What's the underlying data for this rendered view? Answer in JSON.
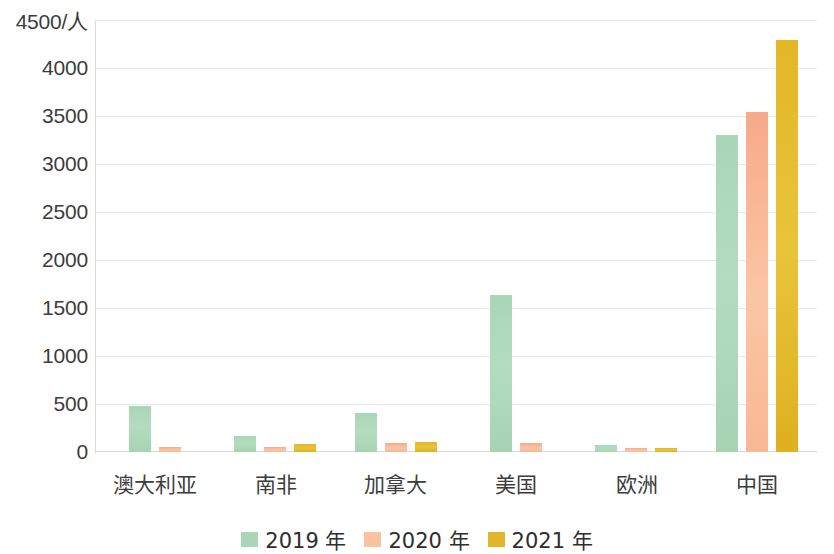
{
  "chart_data": {
    "type": "bar",
    "title": "",
    "xlabel": "",
    "ylabel": "4500/人",
    "unit_label": "/人",
    "ylim": [
      0,
      4500
    ],
    "ytick_step": 500,
    "yticks": [
      "4500/人",
      "4000",
      "3500",
      "3000",
      "2500",
      "2000",
      "1500",
      "1000",
      "500",
      "0"
    ],
    "ytick_values": [
      4500,
      4000,
      3500,
      3000,
      2500,
      2000,
      1500,
      1000,
      500,
      0
    ],
    "grid": true,
    "legend_position": "bottom-center",
    "categories": [
      "澳大利亚",
      "南非",
      "加拿大",
      "美国",
      "欧洲",
      "中国"
    ],
    "series": [
      {
        "name": "2019 年",
        "color": "#a9d6b6",
        "values": [
          480,
          165,
          405,
          1640,
          70,
          3300
        ]
      },
      {
        "name": "2020 年",
        "color": "#f9c3a1",
        "values": [
          50,
          50,
          95,
          90,
          45,
          3540
        ]
      },
      {
        "name": "2021 年",
        "color": "#e1b62b",
        "values": [
          0,
          85,
          100,
          0,
          40,
          4290
        ]
      }
    ]
  },
  "legend": {
    "items": [
      {
        "label": "2019 年",
        "swatch": "s2019"
      },
      {
        "label": "2020 年",
        "swatch": "s2020"
      },
      {
        "label": "2021 年",
        "swatch": "s2021"
      }
    ]
  }
}
